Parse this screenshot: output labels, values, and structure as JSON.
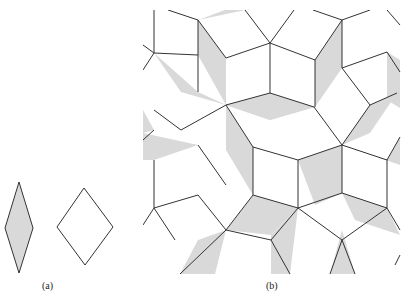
{
  "figure": {
    "panel_a": {
      "label": "(a)",
      "thin_rhombus": {
        "points": "19,182 33,228 19,273 5,228",
        "fill": "#d9d9d9"
      },
      "fat_rhombus": {
        "points": "84,188 113,227 85,265 57,227",
        "fill": "#ffffff"
      }
    },
    "panel_b": {
      "label": "(b)",
      "clip": {
        "x": 143,
        "y": 10,
        "w": 261,
        "h": 264
      },
      "shade_color": "#d9d9d9",
      "stroke_color": "#333333",
      "shaded_tiles": [
        "198,20 225,10 245,10 198,20",
        "198,20 226,58 226,105 198,55",
        "154,53 181,92 226,105 198,92",
        "226,105 270,93 314,107 270,120",
        "226,105 253,147 253,195 226,150",
        "143,133 198,145 154,160 143,160",
        "315,60 342,20 342,68 315,107",
        "342,145 370,105 397,93 370,133",
        "342,145 387,160 400,137 400,165",
        "387,52 400,60 400,108 387,100",
        "270,93 315,107 270,120 226,105",
        "253,195 298,208 271,235 226,230",
        "342,145 342,193 315,205 298,160",
        "342,193 387,208 400,235 355,220",
        "298,208 271,235 271,274 290,274",
        "198,240 226,230 215,274 180,274",
        "342,230 330,274 355,274",
        "143,110 154,130 143,133"
      ],
      "edges": [
        "154,10 154,53",
        "168,10 198,20",
        "154,53 143,45",
        "154,53 143,70",
        "154,53 198,55",
        "198,20 198,92",
        "198,20 226,58",
        "226,58 270,43",
        "245,10 270,43",
        "294,10 270,43",
        "270,43 270,93",
        "270,43 315,60",
        "313,10 342,20",
        "342,20 370,10",
        "342,20 342,68",
        "342,20 315,60",
        "315,60 315,107",
        "342,68 387,52",
        "387,10 400,25",
        "387,52 400,72",
        "342,68 370,105",
        "226,105 270,93",
        "226,105 181,130",
        "181,130 154,110",
        "154,130 143,140",
        "226,105 253,147",
        "253,147 298,160",
        "298,160 342,145",
        "342,145 370,105",
        "342,145 314,107",
        "314,107 270,93",
        "370,105 397,93",
        "342,145 387,160",
        "387,160 400,137",
        "198,145 226,185",
        "154,160 154,208",
        "154,208 198,195",
        "198,195 226,230",
        "226,230 253,195",
        "253,195 253,147",
        "253,195 298,208",
        "298,208 342,193",
        "342,193 342,145",
        "342,193 387,208",
        "387,160 387,208",
        "298,160 298,208",
        "154,208 143,225",
        "154,208 175,240",
        "226,230 180,274",
        "226,230 271,240",
        "271,240 298,208",
        "271,240 290,274",
        "298,208 342,240",
        "342,240 330,274",
        "342,240 355,274",
        "342,240 387,208",
        "387,208 400,230",
        "400,255 395,265"
      ]
    }
  }
}
